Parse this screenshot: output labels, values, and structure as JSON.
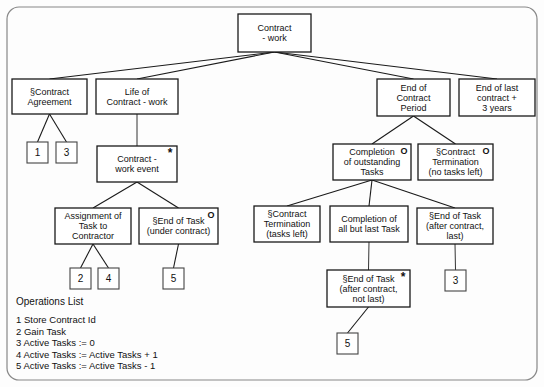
{
  "diagram": {
    "type": "entity-life-history-tree",
    "nodes": [
      {
        "id": "root",
        "label_lines": [
          "Contract",
          "- work"
        ],
        "x": 238,
        "y": 14,
        "w": 73,
        "h": 38,
        "marker": ""
      },
      {
        "id": "agreement",
        "label_lines": [
          "§Contract",
          "Agreement"
        ],
        "x": 12,
        "y": 79,
        "w": 75,
        "h": 35,
        "marker": ""
      },
      {
        "id": "life",
        "label_lines": [
          "Life of",
          "Contract - work"
        ],
        "x": 96,
        "y": 79,
        "w": 82,
        "h": 35,
        "marker": ""
      },
      {
        "id": "endperiod",
        "label_lines": [
          "End of",
          "Contract",
          "Period"
        ],
        "x": 377,
        "y": 79,
        "w": 73,
        "h": 37,
        "marker": ""
      },
      {
        "id": "endlast",
        "label_lines": [
          "End of last",
          "contract +",
          "3 years"
        ],
        "x": 459,
        "y": 79,
        "w": 76,
        "h": 37,
        "marker": ""
      },
      {
        "id": "workevent",
        "label_lines": [
          "Contract -",
          "work event"
        ],
        "x": 97,
        "y": 146,
        "w": 80,
        "h": 36,
        "marker": "*"
      },
      {
        "id": "completion",
        "label_lines": [
          "Completion",
          "of outstanding",
          "Tasks"
        ],
        "x": 333,
        "y": 144,
        "w": 78,
        "h": 36,
        "marker": "O"
      },
      {
        "id": "termnotasks",
        "label_lines": [
          "§Contract",
          "Termination",
          "(no tasks left)"
        ],
        "x": 418,
        "y": 144,
        "w": 75,
        "h": 36,
        "marker": "O"
      },
      {
        "id": "assignment",
        "label_lines": [
          "Assignment of",
          "Task to",
          "Contractor"
        ],
        "x": 55,
        "y": 208,
        "w": 76,
        "h": 36,
        "marker": ""
      },
      {
        "id": "endtaskuc",
        "label_lines": [
          "§End of Task",
          "(under contract)"
        ],
        "x": 139,
        "y": 208,
        "w": 79,
        "h": 36,
        "marker": "O"
      },
      {
        "id": "termtasks",
        "label_lines": [
          "§Contract",
          "Termination",
          "(tasks left)"
        ],
        "x": 254,
        "y": 206,
        "w": 66,
        "h": 36,
        "marker": ""
      },
      {
        "id": "complallbut",
        "label_lines": [
          "Completion of",
          "all but last Task"
        ],
        "x": 330,
        "y": 206,
        "w": 78,
        "h": 36,
        "marker": ""
      },
      {
        "id": "endtasklast",
        "label_lines": [
          "§End of Task",
          "(after contract,",
          "last)"
        ],
        "x": 417,
        "y": 208,
        "w": 76,
        "h": 36,
        "marker": ""
      },
      {
        "id": "endtasknl",
        "label_lines": [
          "§End of Task",
          "(after contract,",
          "not last)"
        ],
        "x": 327,
        "y": 270,
        "w": 83,
        "h": 37,
        "marker": "*"
      }
    ],
    "operation_boxes": [
      {
        "id": "op-1",
        "label": "1",
        "x": 27,
        "y": 142,
        "w": 21,
        "h": 21
      },
      {
        "id": "op-3a",
        "label": "3",
        "x": 56,
        "y": 142,
        "w": 21,
        "h": 21
      },
      {
        "id": "op-2",
        "label": "2",
        "x": 70,
        "y": 268,
        "w": 21,
        "h": 21
      },
      {
        "id": "op-4",
        "label": "4",
        "x": 98,
        "y": 268,
        "w": 21,
        "h": 21
      },
      {
        "id": "op-5a",
        "label": "5",
        "x": 163,
        "y": 268,
        "w": 21,
        "h": 21
      },
      {
        "id": "op-3b",
        "label": "3",
        "x": 445,
        "y": 270,
        "w": 21,
        "h": 21
      },
      {
        "id": "op-5b",
        "label": "5",
        "x": 337,
        "y": 333,
        "w": 21,
        "h": 21
      }
    ],
    "connections": [
      {
        "from": "root",
        "to": "agreement"
      },
      {
        "from": "root",
        "to": "life"
      },
      {
        "from": "root",
        "to": "endperiod"
      },
      {
        "from": "root",
        "to": "endlast"
      },
      {
        "from": "agreement",
        "to": "op-1"
      },
      {
        "from": "agreement",
        "to": "op-3a"
      },
      {
        "from": "life",
        "to": "workevent"
      },
      {
        "from": "workevent",
        "to": "assignment"
      },
      {
        "from": "workevent",
        "to": "endtaskuc"
      },
      {
        "from": "assignment",
        "to": "op-2"
      },
      {
        "from": "assignment",
        "to": "op-4"
      },
      {
        "from": "endtaskuc",
        "to": "op-5a"
      },
      {
        "from": "endperiod",
        "to": "completion"
      },
      {
        "from": "endperiod",
        "to": "termnotasks"
      },
      {
        "from": "completion",
        "to": "termtasks"
      },
      {
        "from": "completion",
        "to": "complallbut"
      },
      {
        "from": "completion",
        "to": "endtasklast"
      },
      {
        "from": "complallbut",
        "to": "endtasknl"
      },
      {
        "from": "endtasklast",
        "to": "op-3b"
      },
      {
        "from": "endtasknl",
        "to": "op-5b"
      }
    ]
  },
  "legend": {
    "title": "Operations List",
    "items": [
      "1 Store Contract Id",
      "2 Gain Task",
      "3 Active Tasks := 0",
      "4 Active Tasks := Active Tasks + 1",
      "5 Active Tasks := Active Tasks - 1"
    ],
    "x": 16,
    "y": 305
  },
  "colors": {
    "background": "#fdfdfd",
    "frame_stroke": "#888888",
    "box_stroke": "#1a1a1a",
    "text": "#111111"
  }
}
